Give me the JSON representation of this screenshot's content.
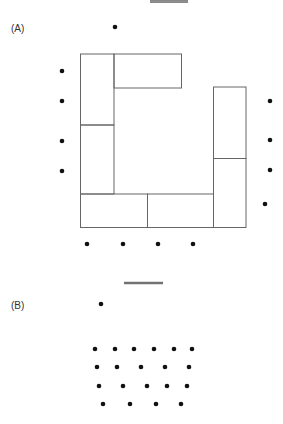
{
  "panels": [
    {
      "label": "(A)",
      "label_pos": [
        11,
        23
      ],
      "bar": {
        "x1": 150,
        "x2": 188,
        "y": 1.5
      },
      "rects": [
        {
          "x": 80.5,
          "y": 54,
          "w": 33.5,
          "h": 71
        },
        {
          "x": 114,
          "y": 54,
          "w": 67.5,
          "h": 34
        },
        {
          "x": 80.5,
          "y": 125,
          "w": 33.5,
          "h": 69
        },
        {
          "x": 80.5,
          "y": 194,
          "w": 67,
          "h": 33.5
        },
        {
          "x": 147.5,
          "y": 194,
          "w": 66,
          "h": 33.5
        },
        {
          "x": 213.5,
          "y": 87,
          "w": 32.5,
          "h": 71.5
        },
        {
          "x": 213.5,
          "y": 158.5,
          "w": 32.5,
          "h": 69
        }
      ],
      "dots": [
        [
          115,
          27
        ],
        [
          62,
          71
        ],
        [
          62,
          101
        ],
        [
          62,
          141
        ],
        [
          62,
          171
        ],
        [
          270,
          101
        ],
        [
          270,
          140
        ],
        [
          270,
          170
        ],
        [
          265,
          204
        ],
        [
          87,
          244
        ],
        [
          123,
          244
        ],
        [
          158,
          244
        ],
        [
          193,
          244
        ]
      ]
    },
    {
      "label": "(B)",
      "label_pos": [
        11,
        300
      ],
      "bar": {
        "x1": 124,
        "x2": 163,
        "y": 283
      },
      "rects": [],
      "dots": [
        [
          101,
          304
        ],
        [
          95,
          349
        ],
        [
          115,
          349
        ],
        [
          134,
          349
        ],
        [
          154,
          349
        ],
        [
          174,
          349
        ],
        [
          192,
          349
        ],
        [
          97,
          367
        ],
        [
          117,
          367
        ],
        [
          141,
          367
        ],
        [
          165,
          367
        ],
        [
          189,
          367
        ],
        [
          99,
          386
        ],
        [
          123,
          386
        ],
        [
          147,
          386
        ],
        [
          167,
          386
        ],
        [
          187,
          386
        ],
        [
          103,
          404
        ],
        [
          130,
          404
        ],
        [
          156,
          404
        ],
        [
          181,
          404
        ]
      ]
    }
  ],
  "style": {
    "line_color": "#666666",
    "dot_color": "#111111",
    "bar_color": "#555555"
  }
}
